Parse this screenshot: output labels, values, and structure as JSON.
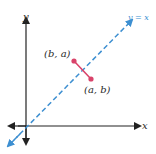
{
  "diagram": {
    "x_axis_label": "x",
    "y_axis_label": "y",
    "line_label": "y = x",
    "point_1_label": "(b, a)",
    "point_2_label": "(a, b)",
    "colors": {
      "axes": "#222222",
      "line": "#3d8fd1",
      "segment": "#d9436a",
      "text": "#2a2a2a"
    }
  }
}
